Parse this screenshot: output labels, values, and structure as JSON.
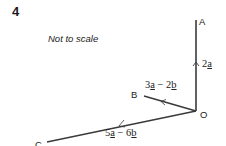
{
  "question": {
    "number": "4",
    "note": "Not to scale"
  },
  "points": {
    "A": {
      "label": "A"
    },
    "B": {
      "label": "B"
    },
    "C": {
      "label": "C"
    },
    "O": {
      "label": "O"
    }
  },
  "vectors": {
    "OA": {
      "coef": "2",
      "var": "a"
    },
    "OB": {
      "c1": "3",
      "v1": "a",
      "op": " − ",
      "c2": "2",
      "v2": "b"
    },
    "OC": {
      "c1": "5",
      "v1": "a",
      "op": " − ",
      "c2": "6",
      "v2": "b"
    }
  },
  "colors": {
    "line": "#3a3a3a",
    "text": "#222222"
  }
}
